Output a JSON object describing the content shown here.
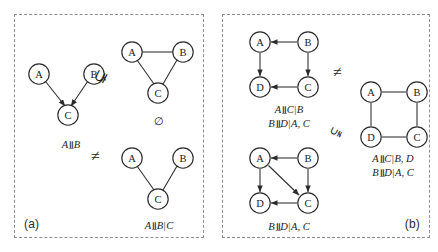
{
  "figure": {
    "type": "diagram",
    "panels": [
      {
        "id": "a",
        "label": "(a)",
        "graphs": [
          {
            "id": "a-dag-collider",
            "kind": "directed",
            "nodes": [
              "A",
              "B",
              "C"
            ],
            "edges": [
              {
                "from": "A",
                "to": "C",
                "directed": true
              },
              {
                "from": "B",
                "to": "C",
                "directed": true
              }
            ],
            "caption": "A ⪻ B",
            "caption_parts": {
              "lhs": "A",
              "op": "⫫",
              "rhs": "B",
              "given": ""
            }
          },
          {
            "id": "a-ug-triangle",
            "kind": "undirected",
            "nodes": [
              "A",
              "B",
              "C"
            ],
            "edges": [
              {
                "from": "A",
                "to": "B",
                "directed": false
              },
              {
                "from": "A",
                "to": "C",
                "directed": false
              },
              {
                "from": "B",
                "to": "C",
                "directed": false
              }
            ],
            "caption": "∅",
            "caption_parts": {
              "lhs": "∅",
              "op": "",
              "rhs": "",
              "given": ""
            }
          },
          {
            "id": "a-ug-chain",
            "kind": "undirected",
            "nodes": [
              "A",
              "B",
              "C"
            ],
            "edges": [
              {
                "from": "A",
                "to": "C",
                "directed": false
              },
              {
                "from": "B",
                "to": "C",
                "directed": false
              }
            ],
            "caption": "A ⫫ B | C",
            "caption_parts": {
              "lhs": "A",
              "op": "⫫",
              "rhs": "B",
              "given": "C"
            }
          }
        ],
        "operators": [
          {
            "id": "a-op-top",
            "glyph": "⊊",
            "meaning": "not-subset-of-rotated"
          },
          {
            "id": "a-op-bottom",
            "glyph": "≠",
            "meaning": "not-equal"
          }
        ]
      },
      {
        "id": "b",
        "label": "(b)",
        "graphs": [
          {
            "id": "b-dag-square",
            "kind": "directed",
            "nodes": [
              "A",
              "B",
              "C",
              "D"
            ],
            "edges": [
              {
                "from": "B",
                "to": "A",
                "directed": true
              },
              {
                "from": "A",
                "to": "D",
                "directed": true
              },
              {
                "from": "B",
                "to": "C",
                "directed": true
              },
              {
                "from": "C",
                "to": "D",
                "directed": true
              }
            ],
            "caption_lines": [
              "A ⫫ C | B",
              "B ⫫ D | A, C"
            ]
          },
          {
            "id": "b-dag-moral",
            "kind": "directed",
            "nodes": [
              "A",
              "B",
              "C",
              "D"
            ],
            "edges": [
              {
                "from": "B",
                "to": "A",
                "directed": true
              },
              {
                "from": "A",
                "to": "D",
                "directed": true
              },
              {
                "from": "A",
                "to": "C",
                "directed": true
              },
              {
                "from": "B",
                "to": "C",
                "directed": true
              },
              {
                "from": "C",
                "to": "D",
                "directed": true
              }
            ],
            "caption_lines": [
              "B ⫫ D | A, C"
            ]
          },
          {
            "id": "b-ug-square",
            "kind": "undirected",
            "nodes": [
              "A",
              "B",
              "C",
              "D"
            ],
            "edges": [
              {
                "from": "A",
                "to": "B",
                "directed": false
              },
              {
                "from": "B",
                "to": "C",
                "directed": false
              },
              {
                "from": "C",
                "to": "D",
                "directed": false
              },
              {
                "from": "D",
                "to": "A",
                "directed": false
              }
            ],
            "caption_lines": [
              "A ⫫ C | B, D",
              "B ⫫ D | A, C"
            ]
          }
        ],
        "operators": [
          {
            "id": "b-op-top",
            "glyph": "≠",
            "meaning": "not-equal"
          },
          {
            "id": "b-op-bottom",
            "glyph": "⫋",
            "meaning": "proper-superset-rotated"
          }
        ]
      }
    ]
  },
  "nodes": {
    "A": "A",
    "B": "B",
    "C": "C",
    "D": "D"
  },
  "captions": {
    "a_dag": {
      "lhs": "A",
      "op": "⫫",
      "rhs": "B"
    },
    "a_triangle": {
      "text": "∅"
    },
    "a_ug": {
      "lhs": "A",
      "op": "⫫",
      "rhs": "B",
      "bar": "|",
      "given": "C"
    },
    "b_dag_l1": {
      "lhs": "A",
      "op": "⫫",
      "rhs": "C",
      "bar": "|",
      "given": "B"
    },
    "b_dag_l2": {
      "lhs": "B",
      "op": "⫫",
      "rhs": "D",
      "bar": "|",
      "given": "A, C"
    },
    "b_moral_l1": {
      "lhs": "B",
      "op": "⫫",
      "rhs": "D",
      "bar": "|",
      "given": "A, C"
    },
    "b_ug_l1": {
      "lhs": "A",
      "op": "⫫",
      "rhs": "C",
      "bar": "|",
      "given": "B, D"
    },
    "b_ug_l2": {
      "lhs": "B",
      "op": "⫫",
      "rhs": "D",
      "bar": "|",
      "given": "A, C"
    }
  },
  "operators": {
    "a_top": "⊊",
    "a_bottom": "≠",
    "b_top": "≠",
    "b_bottom": "⫋"
  },
  "labels": {
    "panel_a": "(a)",
    "panel_b": "(b)"
  },
  "colors": {
    "stroke": "#2b2b2b",
    "text": "#1a1a1a",
    "border_dashed": "#8f8f8f",
    "background": "#ffffff"
  }
}
